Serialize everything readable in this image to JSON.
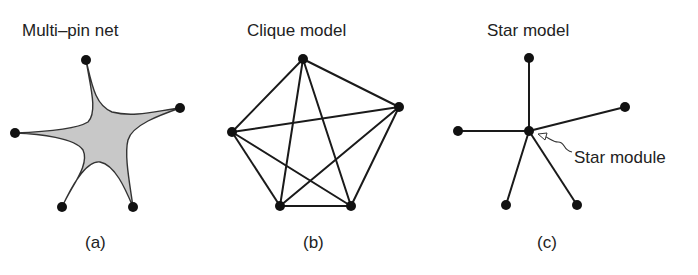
{
  "panels": [
    {
      "id": "a",
      "title": "Multi–pin net",
      "caption": "(a)",
      "nodes": [
        [
          86,
          60
        ],
        [
          180,
          108
        ],
        [
          15,
          133
        ],
        [
          62,
          207
        ],
        [
          133,
          207
        ]
      ],
      "fill_color": "#c8c8c8"
    },
    {
      "id": "b",
      "title": "Clique model",
      "caption": "(b)",
      "nodes": [
        [
          303,
          59
        ],
        [
          399,
          107
        ],
        [
          232,
          132
        ],
        [
          280,
          206
        ],
        [
          351,
          206
        ]
      ]
    },
    {
      "id": "c",
      "title": "Star model",
      "caption": "(c)",
      "center": [
        529,
        131
      ],
      "nodes": [
        [
          529,
          58
        ],
        [
          625,
          107
        ],
        [
          458,
          131
        ],
        [
          506,
          205
        ],
        [
          577,
          205
        ]
      ],
      "annotation": "Star module"
    }
  ]
}
